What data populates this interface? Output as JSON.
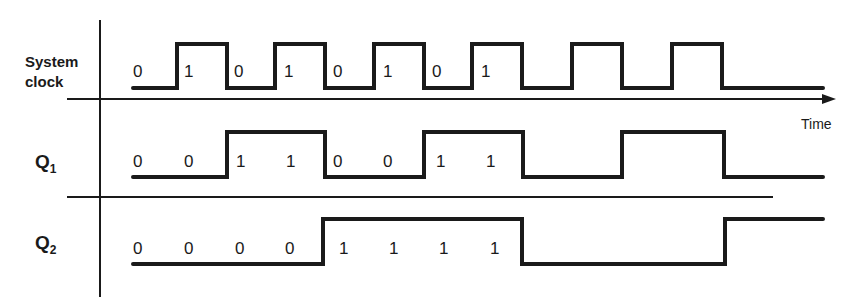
{
  "diagram": {
    "type": "timing-diagram",
    "axis_label": "Time",
    "signals": [
      {
        "name": "System clock",
        "label_lines": [
          "System",
          "clock"
        ],
        "values": [
          "0",
          "1",
          "0",
          "1",
          "0",
          "1",
          "0",
          "1"
        ],
        "edges_x": [
          133,
          177,
          227,
          275,
          325,
          374,
          424,
          472,
          522,
          572,
          622,
          672,
          722,
          823
        ],
        "start_level": 0
      },
      {
        "name": "Q1",
        "label_main": "Q",
        "label_sub": "1",
        "values": [
          "0",
          "0",
          "1",
          "1",
          "0",
          "0",
          "1",
          "1"
        ],
        "edges_x": [
          133,
          227,
          325,
          424,
          522,
          622,
          724,
          823
        ],
        "start_level": 0
      },
      {
        "name": "Q2",
        "label_main": "Q",
        "label_sub": "2",
        "values": [
          "0",
          "0",
          "0",
          "0",
          "1",
          "1",
          "1",
          "1"
        ],
        "edges_x": [
          133,
          323,
          522,
          725,
          823
        ],
        "start_level": 0
      }
    ]
  },
  "labels": {
    "clock_line1": "System",
    "clock_line2": "clock",
    "q1_main": "Q",
    "q1_sub": "1",
    "q2_main": "Q",
    "q2_sub": "2",
    "time": "Time"
  },
  "values": {
    "clock": [
      "0",
      "1",
      "0",
      "1",
      "0",
      "1",
      "0",
      "1"
    ],
    "q1": [
      "0",
      "0",
      "1",
      "1",
      "0",
      "0",
      "1",
      "1"
    ],
    "q2": [
      "0",
      "0",
      "0",
      "0",
      "1",
      "1",
      "1",
      "1"
    ]
  }
}
